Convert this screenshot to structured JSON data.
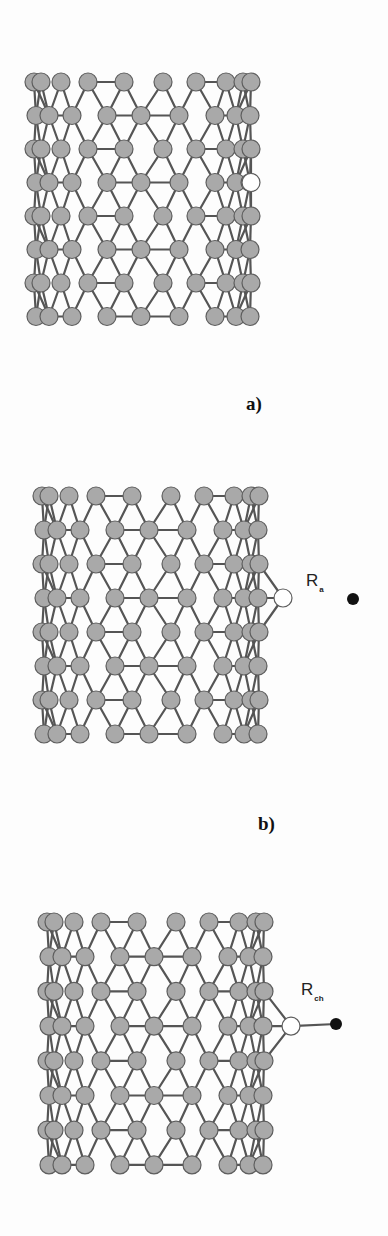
{
  "figure": {
    "width": 388,
    "height": 1236,
    "colors": {
      "atom_fill": "#a9a9a9",
      "atom_stroke": "#5e5e5e",
      "bond": "#555555",
      "defect_fill": "#ffffff",
      "substituent_fill": "#111111",
      "background": "#fdfdfd"
    },
    "atom_radius": 9,
    "lattice": {
      "row_count": 8,
      "row_type_A_x": [
        0,
        7,
        27,
        54,
        90,
        129,
        162,
        192,
        209,
        217
      ],
      "row_type_B_x": [
        2,
        15,
        38,
        73,
        107,
        145,
        181,
        202,
        216
      ],
      "junction_A_index_pairs": [
        [
          3,
          4
        ],
        [
          6,
          7
        ],
        [
          7,
          8
        ]
      ],
      "junction_B_index_pairs": [
        [
          1,
          2
        ],
        [
          3,
          4
        ],
        [
          4,
          5
        ],
        [
          6,
          7
        ]
      ]
    },
    "panels": [
      {
        "id": "a",
        "label": "a)",
        "label_x": 246,
        "label_y": 410,
        "origin_x": 34,
        "origin_y": 82,
        "row_spacing": 33.5,
        "defect": {
          "row": 3,
          "x": 251
        },
        "substituent": null
      },
      {
        "id": "b",
        "label": "b)",
        "label_x": 258,
        "label_y": 830,
        "origin_x": 42,
        "origin_y": 496,
        "row_spacing": 34,
        "defect": {
          "row": 3,
          "x": 283
        },
        "substituent": {
          "label_main": "R",
          "label_sub": "a",
          "label_x": 306,
          "label_y": 586,
          "dot_x": 353,
          "dot_y": 599,
          "bonded": false
        }
      },
      {
        "id": "c",
        "label": "",
        "label_x": 0,
        "label_y": 0,
        "origin_x": 47,
        "origin_y": 922,
        "row_spacing": 34.7,
        "defect": {
          "row": 3,
          "x": 291
        },
        "substituent": {
          "label_main": "R",
          "label_sub": "ch",
          "label_x": 301,
          "label_y": 995,
          "dot_x": 336,
          "dot_y": 1024,
          "bonded": true
        }
      }
    ]
  }
}
